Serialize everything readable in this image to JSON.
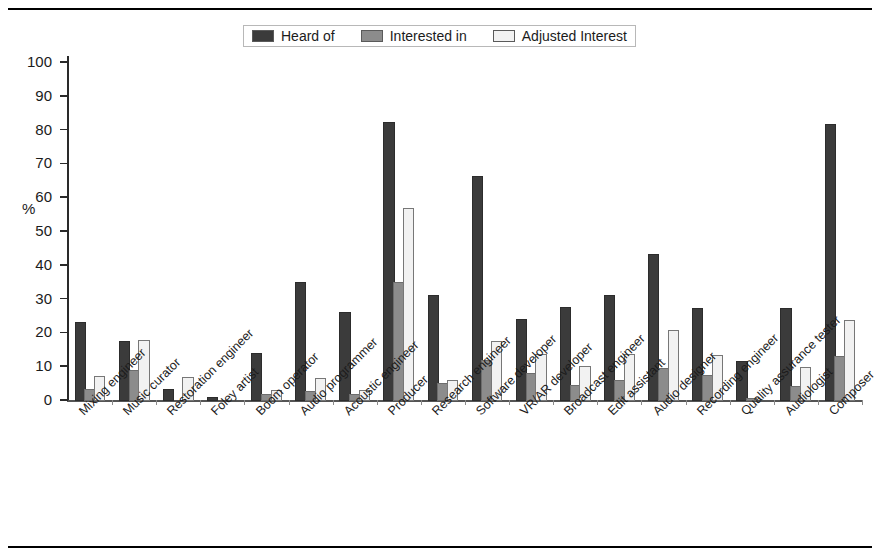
{
  "chart_data": {
    "type": "bar",
    "title": "",
    "subtitle": "",
    "xlabel": "",
    "ylabel": "%",
    "ylim": [
      0,
      100
    ],
    "yticks": [
      0,
      10,
      20,
      30,
      40,
      50,
      60,
      70,
      80,
      90,
      100
    ],
    "grid": false,
    "legend_position": "top-center",
    "categories": [
      "Mixing engineer",
      "Music curator",
      "Restoration engineer",
      "Foley artist",
      "Boom operator",
      "Audio programmer",
      "Acoustic engineer",
      "Producer",
      "Research engineer",
      "Software developer",
      "VR/AR developer",
      "Broadcast engineer",
      "Edit assistant",
      "Audio designer",
      "Recording engineer",
      "Quality assurance tester",
      "Audiologist",
      "Composer"
    ],
    "series": [
      {
        "name": "Heard of",
        "color": "#3b3b3b",
        "values": [
          22.8,
          17.2,
          3.0,
          0.5,
          13.6,
          34.5,
          25.8,
          82.0,
          30.9,
          66.0,
          23.8,
          27.2,
          30.7,
          42.8,
          27.0,
          11.2,
          27.0,
          81.5
        ]
      },
      {
        "name": "Interested in",
        "color": "#8c8c8c",
        "values": [
          3.0,
          8.6,
          0.0,
          0.0,
          1.5,
          2.5,
          1.4,
          34.5,
          4.6,
          11.6,
          7.8,
          4.0,
          5.6,
          9.3,
          7.2,
          0.3,
          3.8,
          12.8
        ]
      },
      {
        "name": "Adjusted Interest",
        "color": "#f2f2f2",
        "values": [
          6.8,
          17.5,
          6.5,
          0.0,
          2.8,
          6.3,
          2.6,
          56.5,
          5.6,
          17.3,
          13.3,
          9.8,
          13.3,
          20.4,
          13.1,
          0.0,
          9.5,
          23.5
        ]
      }
    ]
  },
  "legend": {
    "items": [
      {
        "label": "Heard of",
        "color": "#3b3b3b"
      },
      {
        "label": "Interested in",
        "color": "#8c8c8c"
      },
      {
        "label": "Adjusted Interest",
        "color": "#f2f2f2"
      }
    ]
  },
  "axes": {
    "y_axis_label": "%",
    "y_tick_labels": [
      "0",
      "10",
      "20",
      "30",
      "40",
      "50",
      "60",
      "70",
      "80",
      "90",
      "100"
    ]
  }
}
